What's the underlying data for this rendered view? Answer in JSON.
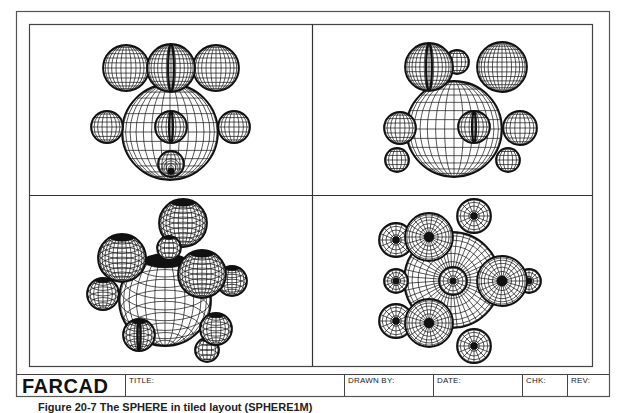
{
  "title_block": {
    "logo": "FARCAD",
    "title_label": "TITLE:",
    "drawn_by_label": "DRAWN BY:",
    "date_label": "DATE:",
    "chk_label": "CHK:",
    "rev_label": "REV:"
  },
  "caption": "Figure 20-7  The SPHERE in tiled layout (SPHERE1M)",
  "colors": {
    "line": "#111111",
    "frame": "#555555",
    "background": "#ffffff"
  },
  "viewports": [
    {
      "name": "front-view",
      "spheres": [
        {
          "cx": 170,
          "cy": 132,
          "r": 48,
          "view": "front"
        },
        {
          "cx": 126,
          "cy": 68,
          "r": 23,
          "view": "front"
        },
        {
          "cx": 216,
          "cy": 68,
          "r": 23,
          "view": "front"
        },
        {
          "cx": 171,
          "cy": 68,
          "r": 24,
          "view": "front",
          "seam": true
        },
        {
          "cx": 107,
          "cy": 127,
          "r": 16,
          "view": "front"
        },
        {
          "cx": 234,
          "cy": 127,
          "r": 16,
          "view": "front"
        },
        {
          "cx": 171,
          "cy": 127,
          "r": 16,
          "view": "front",
          "seam": true
        },
        {
          "cx": 171,
          "cy": 164,
          "r": 13,
          "view": "pole"
        }
      ]
    },
    {
      "name": "side-view",
      "spheres": [
        {
          "cx": 457,
          "cy": 62,
          "r": 12,
          "view": "front"
        },
        {
          "cx": 454,
          "cy": 129,
          "r": 48,
          "view": "front"
        },
        {
          "cx": 429,
          "cy": 67,
          "r": 24,
          "view": "front",
          "seam": true
        },
        {
          "cx": 502,
          "cy": 67,
          "r": 25,
          "view": "front"
        },
        {
          "cx": 400,
          "cy": 128,
          "r": 16,
          "view": "front"
        },
        {
          "cx": 520,
          "cy": 128,
          "r": 17,
          "view": "front"
        },
        {
          "cx": 474,
          "cy": 127,
          "r": 16,
          "view": "front",
          "seam": true
        },
        {
          "cx": 397,
          "cy": 160,
          "r": 12,
          "view": "front"
        },
        {
          "cx": 508,
          "cy": 160,
          "r": 12,
          "view": "front"
        }
      ]
    },
    {
      "name": "isometric-view",
      "spheres": [
        {
          "cx": 232,
          "cy": 281,
          "r": 15,
          "view": "iso"
        },
        {
          "cx": 165,
          "cy": 300,
          "r": 46,
          "view": "iso"
        },
        {
          "cx": 183,
          "cy": 223,
          "r": 24,
          "view": "iso"
        },
        {
          "cx": 103,
          "cy": 294,
          "r": 16,
          "view": "iso"
        },
        {
          "cx": 122,
          "cy": 258,
          "r": 24,
          "view": "iso"
        },
        {
          "cx": 169,
          "cy": 248,
          "r": 12,
          "view": "iso"
        },
        {
          "cx": 202,
          "cy": 274,
          "r": 24,
          "view": "iso"
        },
        {
          "cx": 207,
          "cy": 350,
          "r": 12,
          "view": "iso"
        },
        {
          "cx": 216,
          "cy": 329,
          "r": 16,
          "view": "iso"
        },
        {
          "cx": 139,
          "cy": 335,
          "r": 16,
          "view": "iso",
          "seam": true
        }
      ]
    },
    {
      "name": "top-view",
      "spheres": [
        {
          "cx": 452,
          "cy": 280,
          "r": 48,
          "view": "polar"
        },
        {
          "cx": 396,
          "cy": 240,
          "r": 17,
          "view": "polar"
        },
        {
          "cx": 396,
          "cy": 281,
          "r": 12,
          "view": "polar"
        },
        {
          "cx": 396,
          "cy": 321,
          "r": 17,
          "view": "polar"
        },
        {
          "cx": 529,
          "cy": 281,
          "r": 12,
          "view": "polar"
        },
        {
          "cx": 474,
          "cy": 216,
          "r": 17,
          "view": "polar"
        },
        {
          "cx": 474,
          "cy": 346,
          "r": 17,
          "view": "polar"
        },
        {
          "cx": 429,
          "cy": 237,
          "r": 24,
          "view": "polar"
        },
        {
          "cx": 429,
          "cy": 323,
          "r": 24,
          "view": "polar"
        },
        {
          "cx": 502,
          "cy": 281,
          "r": 25,
          "view": "polar"
        },
        {
          "cx": 453,
          "cy": 281,
          "r": 14,
          "view": "polar"
        }
      ]
    }
  ]
}
